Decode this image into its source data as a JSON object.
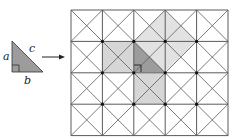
{
  "figure": {
    "type": "pythagorean-theorem-grid-illustration",
    "labels": {
      "a": "a",
      "b": "b",
      "c": "c"
    },
    "colors": {
      "grid_line": "#5a5a5a",
      "grid_node": "#111111",
      "triangle_fill": "#9c9c9c",
      "triangle_stroke": "#333333",
      "leg_square_fill": "#d6d6d6",
      "hyp_square_fill": "#e2e2e2",
      "arrow": "#222222"
    },
    "small_triangle": {
      "vertices": [
        [
          12,
          41
        ],
        [
          12,
          72
        ],
        [
          43,
          72
        ]
      ],
      "right_angle_at": [
        12,
        72
      ],
      "label_positions": {
        "a": [
          3,
          60
        ],
        "c": [
          29,
          52
        ],
        "b": [
          24,
          84
        ]
      }
    },
    "arrow": {
      "from": [
        42,
        57
      ],
      "to": [
        65,
        57
      ]
    },
    "grid": {
      "origin": [
        71,
        10
      ],
      "cols": 5,
      "rows": 4,
      "cell": 31.4,
      "diagonals": true
    },
    "shaded": {
      "hyp_square": [
        [
          165,
          10
        ],
        [
          197,
          41
        ],
        [
          165,
          72
        ],
        [
          134,
          41
        ]
      ],
      "leg_a_square": [
        [
          102,
          41
        ],
        [
          134,
          41
        ],
        [
          134,
          72
        ],
        [
          102,
          72
        ]
      ],
      "leg_b_square": [
        [
          134,
          72
        ],
        [
          165,
          72
        ],
        [
          165,
          104
        ],
        [
          134,
          104
        ]
      ],
      "triangle": [
        [
          134,
          41
        ],
        [
          134,
          72
        ],
        [
          165,
          72
        ]
      ],
      "right_angle_at": [
        134,
        72
      ]
    }
  }
}
